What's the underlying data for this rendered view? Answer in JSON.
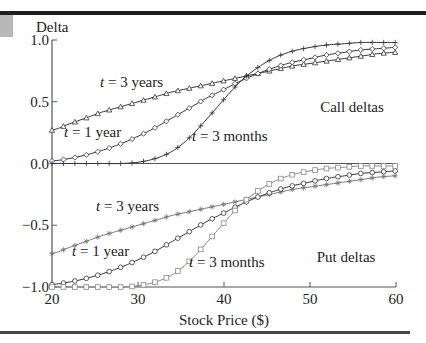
{
  "chart_data": {
    "type": "line",
    "title": "",
    "xlabel": "Stock Price ($)",
    "ylabel": "Delta",
    "xlim": [
      20,
      60
    ],
    "ylim": [
      -1.0,
      1.0
    ],
    "x_ticks": [
      "20",
      "30",
      "40",
      "50",
      "60"
    ],
    "y_ticks": [
      "1.0",
      "0.5",
      "0.0",
      "-0.5",
      "-1.0"
    ],
    "grid": false,
    "legend": "none (inline annotations)",
    "annotations": {
      "call_group": "Call deltas",
      "put_group": "Put deltas",
      "call_3y": "t = 3 years",
      "call_1y": "t = 1 year",
      "call_3m": "t = 3 months",
      "put_3y": "t = 3 years",
      "put_1y": "t = 1 year",
      "put_3m": "t = 3 months"
    },
    "x": [
      20,
      22,
      24,
      26,
      28,
      30,
      32,
      34,
      36,
      38,
      40,
      42,
      44,
      46,
      48,
      50,
      52,
      54,
      56,
      58,
      60
    ],
    "series": [
      {
        "name": "Call delta, t = 3 years",
        "marker": "triangle",
        "values": [
          0.27,
          0.32,
          0.37,
          0.42,
          0.46,
          0.5,
          0.54,
          0.58,
          0.61,
          0.64,
          0.67,
          0.7,
          0.73,
          0.76,
          0.79,
          0.81,
          0.83,
          0.85,
          0.87,
          0.89,
          0.9
        ]
      },
      {
        "name": "Call delta, t = 1 year",
        "marker": "diamond",
        "values": [
          0.02,
          0.04,
          0.07,
          0.11,
          0.16,
          0.22,
          0.29,
          0.37,
          0.45,
          0.53,
          0.6,
          0.67,
          0.73,
          0.78,
          0.82,
          0.85,
          0.88,
          0.9,
          0.92,
          0.93,
          0.94
        ]
      },
      {
        "name": "Call delta, t = 3 months",
        "marker": "plus",
        "values": [
          0.0,
          0.0,
          0.0,
          0.0,
          0.0,
          0.01,
          0.04,
          0.1,
          0.21,
          0.36,
          0.52,
          0.67,
          0.78,
          0.86,
          0.91,
          0.94,
          0.96,
          0.97,
          0.98,
          0.98,
          0.98
        ]
      },
      {
        "name": "Put delta, t = 3 years",
        "marker": "star",
        "values": [
          -0.73,
          -0.68,
          -0.63,
          -0.58,
          -0.54,
          -0.5,
          -0.46,
          -0.42,
          -0.39,
          -0.36,
          -0.33,
          -0.3,
          -0.27,
          -0.24,
          -0.21,
          -0.19,
          -0.17,
          -0.15,
          -0.13,
          -0.11,
          -0.1
        ]
      },
      {
        "name": "Put delta, t = 1 year",
        "marker": "circle",
        "values": [
          -0.98,
          -0.96,
          -0.93,
          -0.89,
          -0.84,
          -0.78,
          -0.71,
          -0.63,
          -0.55,
          -0.47,
          -0.4,
          -0.33,
          -0.27,
          -0.22,
          -0.18,
          -0.15,
          -0.12,
          -0.1,
          -0.08,
          -0.07,
          -0.06
        ]
      },
      {
        "name": "Put delta, t = 3 months",
        "marker": "square",
        "values": [
          -1.0,
          -1.0,
          -1.0,
          -1.0,
          -1.0,
          -0.99,
          -0.96,
          -0.9,
          -0.79,
          -0.64,
          -0.48,
          -0.33,
          -0.22,
          -0.14,
          -0.09,
          -0.06,
          -0.04,
          -0.03,
          -0.02,
          -0.02,
          -0.02
        ]
      }
    ]
  }
}
